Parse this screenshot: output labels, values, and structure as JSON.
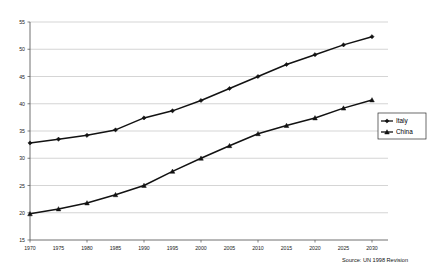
{
  "chart_data": {
    "type": "line",
    "title": "",
    "subtitle": "",
    "xlabel": "",
    "ylabel": "",
    "grid": true,
    "gridlines": "horizontal",
    "legend_position": "right",
    "xlim": [
      1970,
      2030
    ],
    "ylim": [
      15,
      55
    ],
    "ytick_step": 5,
    "xtick_step": 5,
    "categories": [
      "1970",
      "1975",
      "1980",
      "1985",
      "1990",
      "1995",
      "2000",
      "2005",
      "2010",
      "2015",
      "2020",
      "2025",
      "2030"
    ],
    "x": [
      1970,
      1975,
      1980,
      1985,
      1990,
      1995,
      2000,
      2005,
      2010,
      2015,
      2020,
      2025,
      2030
    ],
    "y_ticks": [
      "15",
      "20",
      "25",
      "30",
      "35",
      "40",
      "45",
      "50",
      "55"
    ],
    "y_tick_values": [
      15,
      20,
      25,
      30,
      35,
      40,
      45,
      50,
      55
    ],
    "series": [
      {
        "name": "Italy",
        "marker": "diamond",
        "color": "#121212",
        "values": [
          32.8,
          33.5,
          34.2,
          35.2,
          37.4,
          38.7,
          40.6,
          42.8,
          45.0,
          47.2,
          49.0,
          50.8,
          52.3
        ]
      },
      {
        "name": "China",
        "marker": "triangle",
        "color": "#121212",
        "values": [
          19.8,
          20.7,
          21.8,
          23.3,
          25.0,
          27.6,
          30.0,
          32.3,
          34.5,
          36.0,
          37.4,
          39.2,
          40.7
        ]
      }
    ],
    "annotations": [
      {
        "name": "source-note",
        "text": "Source: UN 1998 Revision"
      }
    ]
  },
  "legend": {
    "entries": [
      {
        "label": "Italy",
        "marker": "diamond"
      },
      {
        "label": "China",
        "marker": "triangle"
      }
    ]
  },
  "footer": {
    "source": "Source: UN 1998 Revision"
  }
}
